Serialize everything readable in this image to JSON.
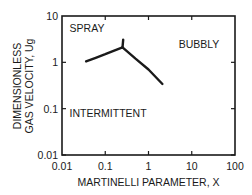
{
  "chart_data": {
    "type": "line",
    "title": "",
    "xlabel": "MARTINELLI PARAMETER, X",
    "ylabel": [
      "DIMENSIONLESS",
      "GAS VELOCITY, Ug"
    ],
    "xscale": "log",
    "yscale": "log",
    "xlim": [
      0.01,
      100
    ],
    "ylim": [
      0.01,
      10
    ],
    "x_ticks": [
      0.01,
      0.1,
      1,
      10,
      100
    ],
    "x_tick_labels": [
      "0.01",
      "0.1",
      "1",
      "10",
      "100"
    ],
    "y_ticks": [
      0.01,
      0.1,
      1,
      10
    ],
    "y_tick_labels": [
      "0.01",
      "0.1",
      "1",
      "10"
    ],
    "grid": false,
    "legend": null,
    "series": [
      {
        "name": "boundary-left",
        "x": [
          0.036,
          0.06,
          0.1,
          0.15,
          0.25
        ],
        "y": [
          1.05,
          1.25,
          1.5,
          1.75,
          2.1
        ]
      },
      {
        "name": "boundary-spike",
        "x": [
          0.25,
          0.26
        ],
        "y": [
          2.1,
          3.1
        ]
      },
      {
        "name": "boundary-right",
        "x": [
          0.25,
          0.5,
          1.0,
          2.1
        ],
        "y": [
          2.1,
          1.2,
          0.7,
          0.34
        ]
      }
    ],
    "annotations": [
      {
        "text": "SPRAY",
        "x": 0.015,
        "y": 4.5
      },
      {
        "text": "BUBBLY",
        "x": 5.0,
        "y": 2.0
      },
      {
        "text": "INTERMITTENT",
        "x": 0.015,
        "y": 0.065
      }
    ]
  },
  "plot": {
    "line_color": "#1a1a1a",
    "frame_color": "#1a1a1a",
    "background": "#ffffff"
  }
}
